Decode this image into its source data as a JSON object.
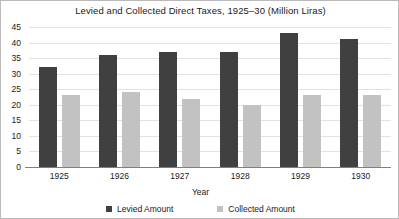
{
  "chart_data": {
    "type": "bar",
    "title": "Levied and Collected Direct Taxes, 1925–30 (Million Liras)",
    "xlabel": "Year",
    "ylabel": "",
    "categories": [
      "1925",
      "1926",
      "1927",
      "1928",
      "1929",
      "1930"
    ],
    "series": [
      {
        "name": "Levied Amount",
        "color": "#404040",
        "values": [
          32,
          36,
          37,
          37,
          43,
          41
        ]
      },
      {
        "name": "Collected Amount",
        "color": "#c2c2c2",
        "values": [
          23,
          24,
          22,
          20,
          23,
          23
        ]
      }
    ],
    "ylim": [
      0,
      45
    ],
    "ytick_step": 5,
    "yticks": [
      0,
      5,
      10,
      15,
      20,
      25,
      30,
      35,
      40,
      45
    ],
    "ytick_labels": [
      "0",
      "5",
      "10",
      "15",
      "20",
      "25",
      "30",
      "35",
      "40",
      "45"
    ],
    "grid": true,
    "grid_axis": "y",
    "legend_position": "bottom",
    "background_color": "#ffffff",
    "grid_color": "#e2e2e2",
    "axis_color": "#808080",
    "border_color": "#b9b9b9"
  }
}
